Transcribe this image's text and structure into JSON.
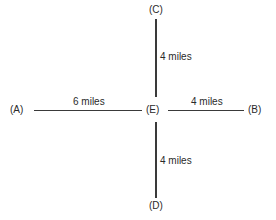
{
  "diagram": {
    "type": "cross-route map",
    "nodes": {
      "A": {
        "label": "(A)"
      },
      "B": {
        "label": "(B)"
      },
      "C": {
        "label": "(C)"
      },
      "D": {
        "label": "(D)"
      },
      "E": {
        "label": "(E)"
      }
    },
    "edges": [
      {
        "from": "A",
        "to": "E",
        "label": "6 miles"
      },
      {
        "from": "E",
        "to": "B",
        "label": "4 miles"
      },
      {
        "from": "C",
        "to": "E",
        "label": "4 miles"
      },
      {
        "from": "E",
        "to": "D",
        "label": "4 miles"
      }
    ]
  }
}
